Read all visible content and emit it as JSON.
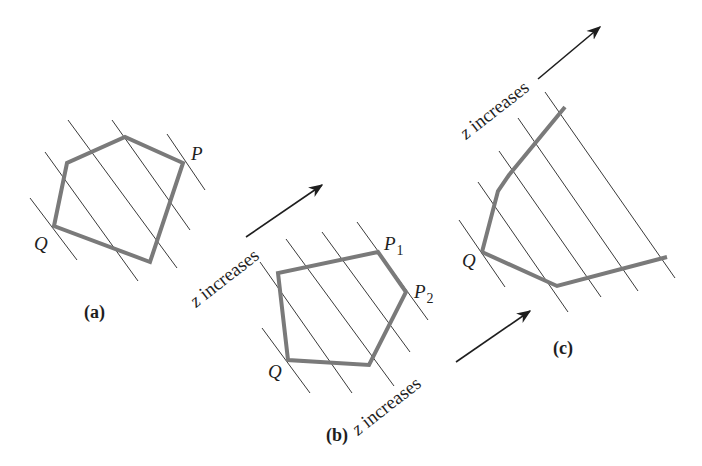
{
  "figure": {
    "panels": [
      {
        "id": "a",
        "caption": "(a)",
        "caption_pos": [
          84,
          318
        ],
        "polygon": [
          [
            54,
            226
          ],
          [
            67,
            163
          ],
          [
            125,
            137
          ],
          [
            183,
            163
          ],
          [
            150,
            262
          ]
        ],
        "closed": true,
        "level_lines": [
          [
            [
              30,
              198
            ],
            [
              77,
              260
            ]
          ],
          [
            [
              45,
              152
            ],
            [
              138,
              281
            ]
          ],
          [
            [
              68,
              120
            ],
            [
              177,
              268
            ]
          ],
          [
            [
              112,
              120
            ],
            [
              190,
              230
            ]
          ],
          [
            [
              167,
              134
            ],
            [
              205,
              190
            ]
          ]
        ],
        "labels": [
          {
            "text": "P",
            "x": 191,
            "y": 160,
            "italic": true
          },
          {
            "text": "Q",
            "x": 34,
            "y": 250,
            "italic": true
          }
        ],
        "arrow": null
      },
      {
        "id": "b",
        "caption": "(b)",
        "caption_pos": [
          326,
          441
        ],
        "polygon": [
          [
            288,
            360
          ],
          [
            278,
            273
          ],
          [
            378,
            252
          ],
          [
            406,
            292
          ],
          [
            369,
            365
          ]
        ],
        "closed": true,
        "level_lines": [
          [
            [
              262,
              328
            ],
            [
              310,
              393
            ]
          ],
          [
            [
              260,
              262
            ],
            [
              352,
              393
            ]
          ],
          [
            [
              286,
              239
            ],
            [
              394,
              386
            ]
          ],
          [
            [
              322,
              232
            ],
            [
              410,
              352
            ]
          ],
          [
            [
              357,
              222
            ],
            [
              428,
              320
            ]
          ]
        ],
        "labels": [
          {
            "text": "P",
            "sub": "1",
            "x": 384,
            "y": 250,
            "italic": true
          },
          {
            "text": "P",
            "sub": "2",
            "x": 414,
            "y": 298,
            "italic": true
          },
          {
            "text": "Q",
            "x": 268,
            "y": 378,
            "italic": true
          }
        ],
        "arrow": {
          "text": "z increases",
          "text_x": 196,
          "text_y": 308,
          "angle": -38,
          "from": [
            246,
            237
          ],
          "to": [
            322,
            185
          ]
        }
      },
      {
        "id": "c",
        "caption": "(c)",
        "caption_pos": [
          553,
          354
        ],
        "polygon": [
          [
            482,
            252
          ],
          [
            498,
            191
          ],
          [
            509,
            175
          ],
          [
            565,
            107
          ]
        ],
        "tail": [
          [
            482,
            252
          ],
          [
            557,
            286
          ],
          [
            667,
            257
          ]
        ],
        "closed": false,
        "level_lines": [
          [
            [
              459,
              220
            ],
            [
              505,
              287
            ]
          ],
          [
            [
              478,
              182
            ],
            [
              568,
              312
            ]
          ],
          [
            [
              499,
              151
            ],
            [
              601,
              297
            ]
          ],
          [
            [
              518,
              118
            ],
            [
              638,
              291
            ]
          ],
          [
            [
              545,
              92
            ],
            [
              675,
              278
            ]
          ]
        ],
        "labels": [
          {
            "text": "Q",
            "x": 462,
            "y": 267,
            "italic": true
          }
        ],
        "arrow": {
          "text": "z increases",
          "text_x": 466,
          "text_y": 140,
          "angle": -38,
          "from": [
            538,
            79
          ],
          "to": [
            600,
            27
          ]
        }
      }
    ],
    "extra_arrow": {
      "text": "z increases",
      "text_x": 358,
      "text_y": 436,
      "angle": -38,
      "from": [
        456,
        362
      ],
      "to": [
        530,
        311
      ]
    },
    "colors": {
      "polygon_stroke": "#7a7a7a",
      "level_line": "#3a3a3a",
      "text": "#1e1e1e",
      "background": "#ffffff"
    }
  }
}
